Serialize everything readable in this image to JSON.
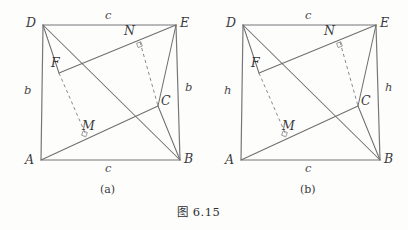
{
  "figure": {
    "caption": "图    6.15",
    "background_color": "#fdfdfc",
    "line_color": "#6f6f70",
    "dash_color": "#8a8a8d",
    "text_color": "#3a3a3c"
  },
  "panels": [
    {
      "id": "a",
      "caption": "(a)",
      "vertex_labels": {
        "D": "D",
        "E": "E",
        "A": "A",
        "B": "B",
        "F": "F",
        "N": "N",
        "M": "M",
        "C": "C"
      },
      "side_labels": {
        "top": "c",
        "bottom": "c",
        "left": "b",
        "right": "b"
      }
    },
    {
      "id": "b",
      "caption": "(b)",
      "vertex_labels": {
        "D": "D",
        "E": "E",
        "A": "A",
        "B": "B",
        "F": "F",
        "N": "N",
        "M": "M",
        "C": "C"
      },
      "side_labels": {
        "top": "c",
        "bottom": "c",
        "left": "h",
        "right": "h"
      }
    }
  ],
  "geometry": {
    "note": "coordinates in screenshot pixels for panel (a); panel (b) is the same shape translated +200px in x",
    "panel_a": {
      "D": [
        43,
        25
      ],
      "E": [
        176,
        25
      ],
      "A": [
        41,
        160
      ],
      "B": [
        180,
        160
      ],
      "F": [
        59,
        73
      ],
      "N": [
        140,
        42
      ],
      "M": [
        86,
        135
      ],
      "C": [
        158,
        106
      ]
    },
    "panel_b_offset_x": 200
  }
}
